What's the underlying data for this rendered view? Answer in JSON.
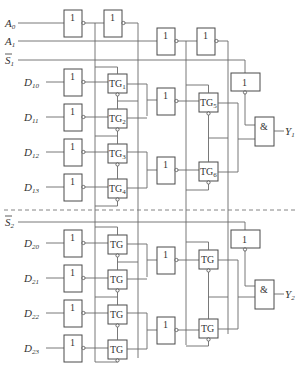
{
  "diagram": {
    "inputs": {
      "A0": {
        "main": "A",
        "sub": "0"
      },
      "A1": {
        "main": "A",
        "sub": "1"
      },
      "S1": {
        "main": "S",
        "sub": "1",
        "overbar": true
      },
      "S2": {
        "main": "S",
        "sub": "2",
        "overbar": true
      },
      "D10": {
        "main": "D",
        "sub": "10"
      },
      "D11": {
        "main": "D",
        "sub": "11"
      },
      "D12": {
        "main": "D",
        "sub": "12"
      },
      "D13": {
        "main": "D",
        "sub": "13"
      },
      "D20": {
        "main": "D",
        "sub": "20"
      },
      "D21": {
        "main": "D",
        "sub": "21"
      },
      "D22": {
        "main": "D",
        "sub": "22"
      },
      "D23": {
        "main": "D",
        "sub": "23"
      }
    },
    "outputs": {
      "Y1": {
        "main": "Y",
        "sub": "1"
      },
      "Y2": {
        "main": "Y",
        "sub": "2"
      }
    },
    "gates": {
      "inverter_symbol": "1",
      "and_symbol": "&",
      "tg_main": "TG",
      "tg_subs": [
        "1",
        "2",
        "3",
        "4",
        "5",
        "6"
      ]
    }
  }
}
